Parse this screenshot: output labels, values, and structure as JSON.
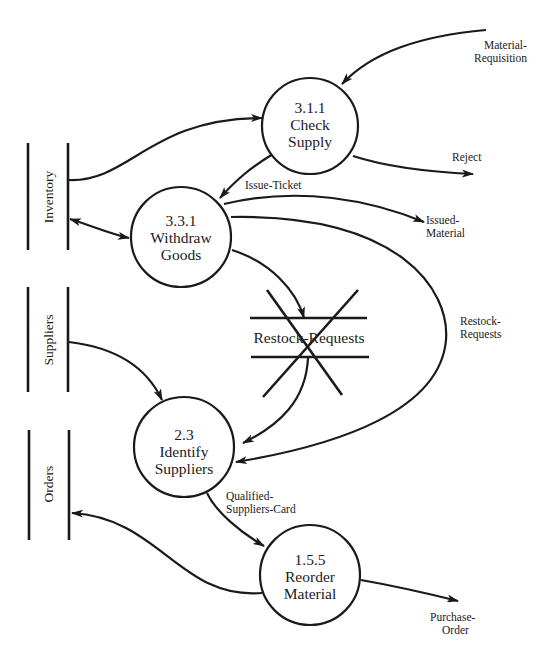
{
  "diagram": {
    "type": "data-flow-diagram",
    "processes": [
      {
        "id": "3.1.1",
        "number": "3.1.1",
        "name": "Check",
        "name2": "Supply",
        "cx": 310,
        "cy": 126,
        "r": 48
      },
      {
        "id": "3.3.1",
        "number": "3.3.1",
        "name": "Withdraw",
        "name2": "Goods",
        "cx": 181,
        "cy": 237,
        "r": 50
      },
      {
        "id": "2.3",
        "number": "2.3",
        "name": "Identify",
        "name2": "Suppliers",
        "cx": 184,
        "cy": 447,
        "r": 50
      },
      {
        "id": "1.5.5",
        "number": "1.5.5",
        "name": "Reorder",
        "name2": "Material",
        "cx": 310,
        "cy": 575,
        "r": 50
      }
    ],
    "stores": [
      {
        "id": "inventory",
        "label": "Inventory"
      },
      {
        "id": "suppliers",
        "label": "Suppliers"
      },
      {
        "id": "orders",
        "label": "Orders"
      }
    ],
    "deleted_store": {
      "label": "Restock-Requests",
      "status": "crossed-out"
    },
    "flows": [
      {
        "label_line1": "Material-",
        "label_line2": "Requisition",
        "from": "external",
        "to": "3.1.1"
      },
      {
        "label_line1": "",
        "label_line2": "",
        "from": "Inventory",
        "to": "3.1.1"
      },
      {
        "label_line1": "Reject",
        "label_line2": "",
        "from": "3.1.1",
        "to": "external"
      },
      {
        "label_line1": "Issue-Ticket",
        "label_line2": "",
        "from": "3.1.1",
        "to": "3.3.1"
      },
      {
        "label_line1": "",
        "label_line2": "",
        "from": "3.3.1",
        "to": "Inventory",
        "bidirectional": true
      },
      {
        "label_line1": "Issued-",
        "label_line2": "Material",
        "from": "3.3.1",
        "to": "external"
      },
      {
        "label_line1": "",
        "label_line2": "",
        "from": "3.3.1",
        "to": "Restock-Requests"
      },
      {
        "label_line1": "",
        "label_line2": "",
        "from": "Restock-Requests",
        "to": "2.3"
      },
      {
        "label_line1": "Restock-",
        "label_line2": "Requests",
        "from": "3.3.1",
        "to": "2.3"
      },
      {
        "label_line1": "",
        "label_line2": "",
        "from": "Suppliers",
        "to": "2.3"
      },
      {
        "label_line1": "Qualified-",
        "label_line2": "Suppliers-Card",
        "from": "2.3",
        "to": "1.5.5"
      },
      {
        "label_line1": "",
        "label_line2": "",
        "from": "1.5.5",
        "to": "Orders"
      },
      {
        "label_line1": "Purchase-",
        "label_line2": "Order",
        "from": "1.5.5",
        "to": "external"
      }
    ],
    "colors": {
      "ink": "#1a1a1a",
      "background": "#ffffff"
    }
  },
  "caption": {
    "text": ""
  }
}
